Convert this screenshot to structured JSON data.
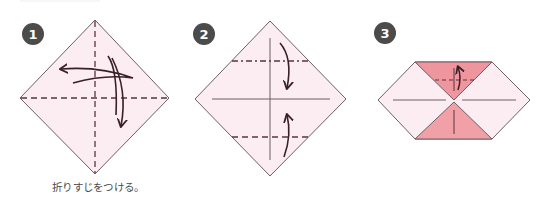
{
  "steps": [
    {
      "number": "1",
      "caption": "折りすじをつける。"
    },
    {
      "number": "2",
      "caption": ""
    },
    {
      "number": "3",
      "caption": ""
    }
  ],
  "colors": {
    "paper_light": "#fbedf2",
    "paper_folded": "#ef959e",
    "outline": "#6d6065",
    "fold_line": "#5a3440",
    "arrow": "#3a1f28",
    "badge": "#4b4b4b",
    "badge_text": "#ffffff"
  },
  "icons": {
    "valley_fold": "dashed-line",
    "crease": "solid-line",
    "fold_arrow": "curved-arrow"
  }
}
